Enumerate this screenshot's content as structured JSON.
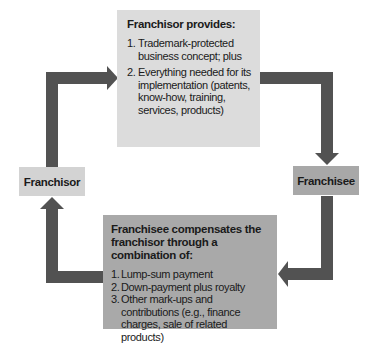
{
  "diagram": {
    "colors": {
      "arrow": "#525252",
      "top_box": "#dcdcdc",
      "bottom_box": "#a9a9a9",
      "franchisor_node": "#d3d3d3",
      "franchisee_node": "#a8a8a8"
    },
    "nodes": {
      "franchisor": "Franchisor",
      "franchisee": "Franchisee"
    },
    "top_box": {
      "title": "Franchisor provides:",
      "items": [
        {
          "num": "1.",
          "text": "Trademark-protected business concept; plus"
        },
        {
          "num": "2.",
          "text": "Everything needed for its implementation (patents, know-how, training, services, products)"
        }
      ]
    },
    "bottom_box": {
      "title": "Franchisee compensates the franchisor through a combination of:",
      "items": [
        {
          "num": "1.",
          "text": "Lump-sum payment"
        },
        {
          "num": "2.",
          "text": "Down-payment plus royalty"
        },
        {
          "num": "3.",
          "text": "Other mark-ups and contributions (e.g., finance charges, sale of related products)"
        }
      ]
    },
    "flow": [
      {
        "from": "Franchisor",
        "to": "Franchisor provides box"
      },
      {
        "from": "Franchisor provides box",
        "to": "Franchisee"
      },
      {
        "from": "Franchisee",
        "to": "Franchisee compensates box"
      },
      {
        "from": "Franchisee compensates box",
        "to": "Franchisor"
      }
    ]
  }
}
